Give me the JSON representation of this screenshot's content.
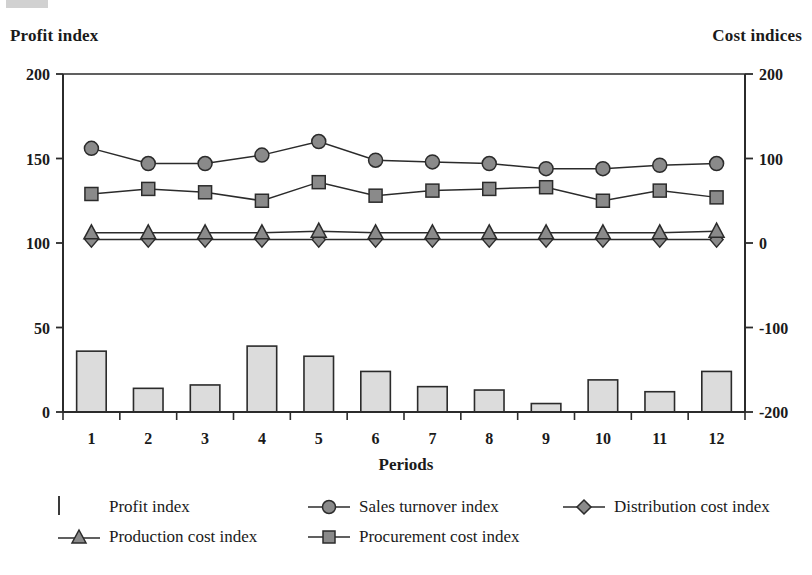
{
  "chart_data": {
    "type": "bar",
    "title": "",
    "categories": [
      "1",
      "2",
      "3",
      "4",
      "5",
      "6",
      "7",
      "8",
      "9",
      "10",
      "11",
      "12"
    ],
    "xlabel": "Periods",
    "left_axis": {
      "label": "Profit index",
      "ticks": [
        "0",
        "50",
        "100",
        "150",
        "200"
      ],
      "tick_values": [
        0,
        50,
        100,
        150,
        200
      ],
      "ylim": [
        0,
        200
      ]
    },
    "right_axis": {
      "label": "Cost  indices",
      "ticks": [
        "-200",
        "-100",
        "0",
        "100",
        "200"
      ],
      "tick_values": [
        -200,
        -100,
        0,
        100,
        200
      ],
      "ylim": [
        -200,
        200
      ]
    },
    "grid": false,
    "legend_position": "bottom",
    "series": [
      {
        "name": "Profit index",
        "type": "bar",
        "axis": "left",
        "marker": "square-swatch",
        "fill": "#dcdcdc",
        "values": [
          36,
          14,
          16,
          39,
          33,
          24,
          15,
          13,
          5,
          19,
          12,
          24
        ]
      },
      {
        "name": "Sales turnover index",
        "type": "line",
        "axis": "left",
        "marker": "circle",
        "fill": "#8a8a8a",
        "values": [
          156,
          147,
          147,
          152,
          160,
          149,
          148,
          147,
          144,
          144,
          146,
          147
        ]
      },
      {
        "name": "Distribution cost index",
        "type": "line",
        "axis": "left",
        "marker": "diamond",
        "fill": "#8a8a8a",
        "values": [
          102,
          102,
          102,
          102,
          102,
          102,
          102,
          102,
          102,
          102,
          102,
          102
        ]
      },
      {
        "name": "Production cost index",
        "type": "line",
        "axis": "left",
        "marker": "triangle",
        "fill": "#8a8a8a",
        "values": [
          106,
          106,
          106,
          106,
          107,
          106,
          106,
          106,
          106,
          106,
          106,
          107
        ]
      },
      {
        "name": "Procurement cost index",
        "type": "line",
        "axis": "left",
        "marker": "square",
        "fill": "#8a8a8a",
        "values": [
          129,
          132,
          130,
          125,
          136,
          128,
          131,
          132,
          133,
          125,
          131,
          127
        ]
      }
    ]
  },
  "colors": {
    "marker_fill": "#8a8a8a",
    "bar_fill": "#dcdcdc",
    "stroke": "#2b2b2b",
    "text": "#1a1a1a"
  },
  "legend": {
    "items": [
      {
        "label": "Profit index",
        "key": "bar-swatch"
      },
      {
        "label": "Sales turnover index",
        "key": "circle-marker"
      },
      {
        "label": "Distribution cost index",
        "key": "diamond-marker"
      },
      {
        "label": "Production cost index",
        "key": "triangle-marker"
      },
      {
        "label": "Procurement cost index",
        "key": "square-marker"
      }
    ]
  }
}
